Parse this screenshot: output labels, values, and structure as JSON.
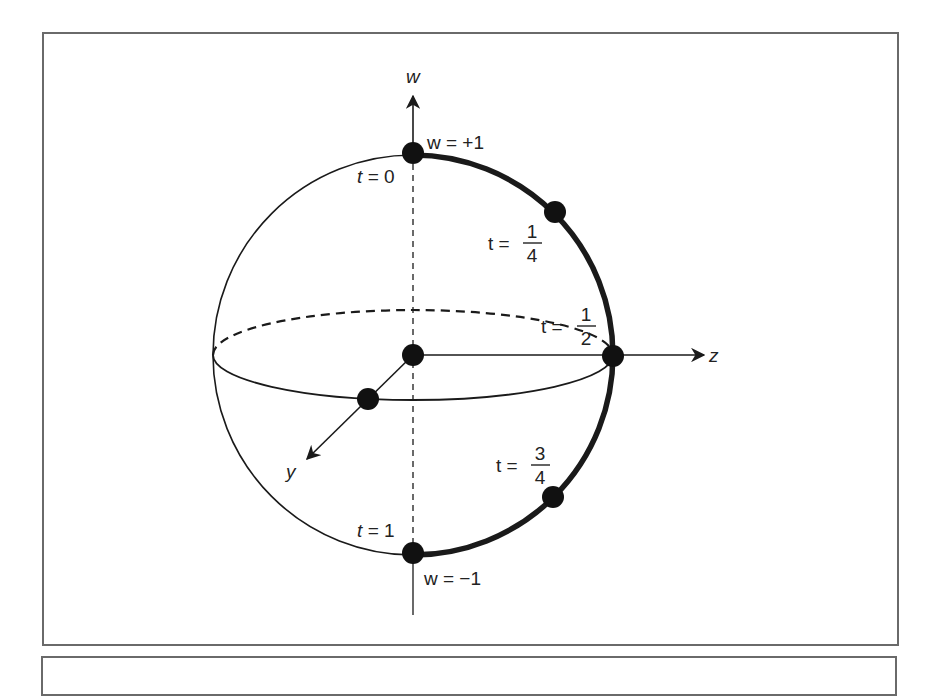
{
  "figure": {
    "axes": {
      "w": "w",
      "z": "z",
      "y": "y"
    },
    "poles": {
      "top": "w = +1",
      "bottom": "w = −1"
    },
    "points": [
      {
        "label_var": "t =",
        "label_value": "0",
        "fraction": false
      },
      {
        "label_var": "t =",
        "numerator": "1",
        "denominator": "4",
        "fraction": true
      },
      {
        "label_var": "t =",
        "numerator": "1",
        "denominator": "2",
        "fraction": true
      },
      {
        "label_var": "t =",
        "numerator": "3",
        "denominator": "4",
        "fraction": true
      },
      {
        "label_var": "t =",
        "label_value": "1",
        "fraction": false
      }
    ],
    "colors": {
      "ink": "#1a1a1a",
      "frame": "#6a6a6a",
      "background": "#ffffff"
    }
  }
}
